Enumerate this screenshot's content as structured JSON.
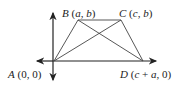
{
  "diagram": {
    "type": "coordinate-geometry-trapezoid",
    "points": {
      "A": {
        "name": "A",
        "coords": "(0, 0)",
        "label": "A (0, 0)"
      },
      "B": {
        "name": "B",
        "coords": "(a, b)",
        "label": "B (a, b)"
      },
      "C": {
        "name": "C",
        "coords": "(c, b)",
        "label": "C (c, b)"
      },
      "D": {
        "name": "D",
        "coords": "(c + a, 0)",
        "label": "D (c + a, 0)"
      }
    },
    "segments": [
      "AB",
      "BC",
      "CD",
      "AD",
      "AC",
      "BD"
    ],
    "axes": {
      "x": "horizontal double arrow",
      "y": "vertical double arrow"
    },
    "colors": {
      "line": "#333333",
      "text": "#222222"
    }
  }
}
